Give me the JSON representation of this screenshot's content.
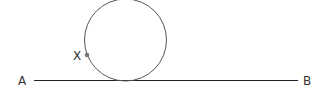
{
  "diagram": {
    "labels": {
      "line_start": "A",
      "line_end": "B",
      "point": "X"
    },
    "colors": {
      "stroke": "#555555",
      "line": "#222222",
      "point": "#777777",
      "text": "#333333"
    }
  }
}
